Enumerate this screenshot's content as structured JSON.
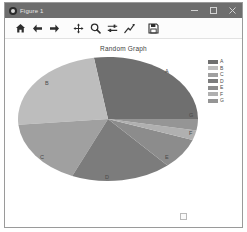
{
  "window": {
    "title": "Figure 1",
    "app_icon": "matplotlib-icon",
    "controls": {
      "minimize": "–",
      "maximize": "□",
      "close": "✕"
    }
  },
  "toolbar": {
    "buttons": [
      {
        "name": "home",
        "label": "Home",
        "icon": "home-icon"
      },
      {
        "name": "back",
        "label": "Back",
        "icon": "arrow-left-icon"
      },
      {
        "name": "forward",
        "label": "Forward",
        "icon": "arrow-right-icon"
      },
      {
        "name": "pan",
        "label": "Pan",
        "icon": "move-cross-icon"
      },
      {
        "name": "zoom",
        "label": "Zoom to rectangle",
        "icon": "magnifier-icon"
      },
      {
        "name": "subplots",
        "label": "Configure subplots",
        "icon": "sliders-icon"
      },
      {
        "name": "customize",
        "label": "Edit axis, curve and image parameters",
        "icon": "curve-edit-icon"
      },
      {
        "name": "save",
        "label": "Save the figure",
        "icon": "save-disk-icon"
      }
    ]
  },
  "status": {
    "coordinates": ""
  },
  "chart_data": {
    "type": "pie",
    "title": "Random Graph",
    "xlabel": "",
    "ylabel": "",
    "legend_position": "right",
    "grid": false,
    "start_angle": 0,
    "counterclock": true,
    "labels": [
      "A",
      "B",
      "C",
      "D",
      "E",
      "F",
      "G"
    ],
    "values": [
      27.5,
      24.0,
      17.0,
      18.0,
      8.0,
      2.5,
      3.0
    ],
    "colors": [
      "#6f6f6f",
      "#bdbdbd",
      "#a0a0a0",
      "#7c7c7c",
      "#8c8c8c",
      "#b0b0b0",
      "#959595"
    ],
    "legend_entries": [
      {
        "label": "A",
        "color": "#6f6f6f"
      },
      {
        "label": "B",
        "color": "#bdbdbd"
      },
      {
        "label": "C",
        "color": "#a0a0a0"
      },
      {
        "label": "D",
        "color": "#7c7c7c"
      },
      {
        "label": "E",
        "color": "#8c8c8c"
      },
      {
        "label": "F",
        "color": "#b0b0b0"
      },
      {
        "label": "G",
        "color": "#959595"
      }
    ],
    "slice_label_positions": [
      {
        "label": "A",
        "x": 152,
        "y": 14
      },
      {
        "label": "B",
        "x": 32,
        "y": 26
      },
      {
        "label": "C",
        "x": 27,
        "y": 100
      },
      {
        "label": "D",
        "x": 92,
        "y": 120
      },
      {
        "label": "E",
        "x": 152,
        "y": 100
      },
      {
        "label": "F",
        "x": 176,
        "y": 76
      },
      {
        "label": "G",
        "x": 176,
        "y": 58
      }
    ]
  }
}
